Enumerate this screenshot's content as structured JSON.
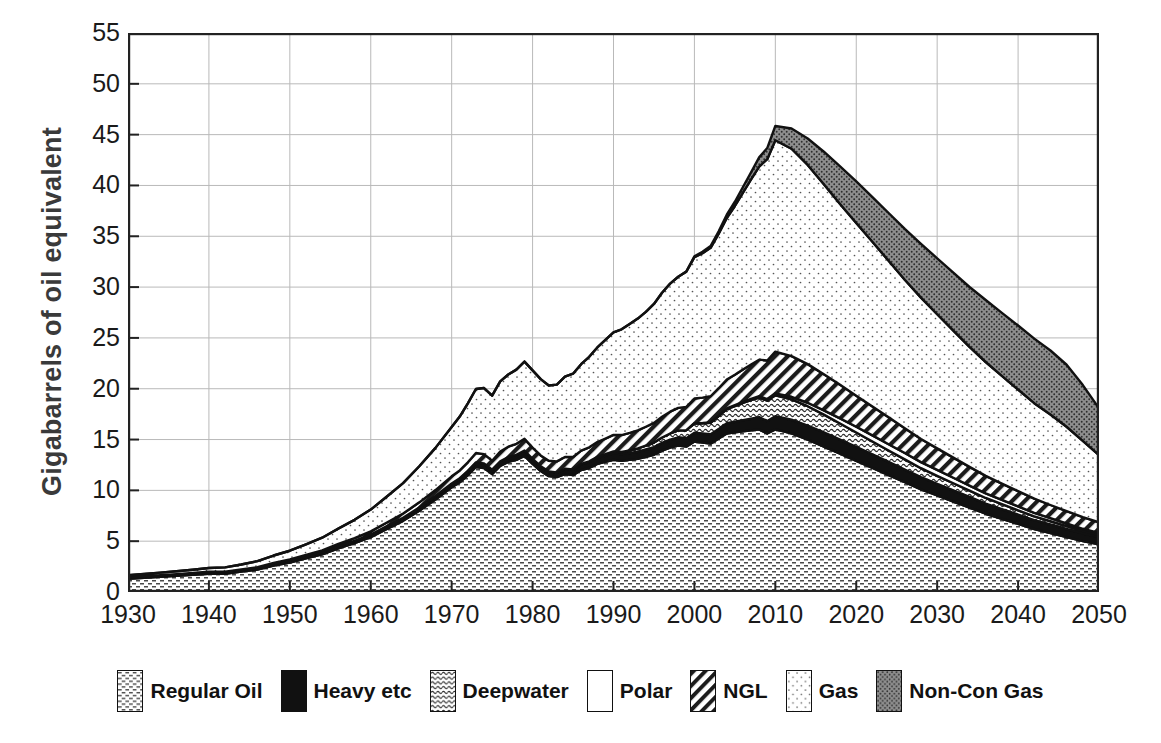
{
  "chart_data": {
    "type": "area",
    "title": "",
    "subtitle": "",
    "xlabel": "",
    "ylabel": "Gigabarrels of oil equivalent",
    "credit": "Credit: the Association for the Study of Peak Oil",
    "xlim": [
      1930,
      2050
    ],
    "ylim": [
      0,
      55
    ],
    "xticks": [
      1930,
      1940,
      1950,
      1960,
      1970,
      1980,
      1990,
      2000,
      2010,
      2020,
      2030,
      2040,
      2050
    ],
    "yticks": [
      0,
      5,
      10,
      15,
      20,
      25,
      30,
      35,
      40,
      45,
      50,
      55
    ],
    "grid": true,
    "legend_position": "bottom",
    "stacked": true,
    "x": [
      1930,
      1932,
      1934,
      1936,
      1938,
      1940,
      1942,
      1944,
      1946,
      1948,
      1950,
      1952,
      1954,
      1956,
      1958,
      1960,
      1962,
      1964,
      1966,
      1968,
      1970,
      1971,
      1972,
      1973,
      1974,
      1975,
      1976,
      1977,
      1978,
      1979,
      1980,
      1981,
      1982,
      1983,
      1984,
      1985,
      1986,
      1987,
      1988,
      1989,
      1990,
      1991,
      1992,
      1993,
      1994,
      1995,
      1996,
      1997,
      1998,
      1999,
      2000,
      2001,
      2002,
      2003,
      2004,
      2005,
      2006,
      2007,
      2008,
      2009,
      2010,
      2012,
      2014,
      2016,
      2018,
      2020,
      2022,
      2024,
      2026,
      2028,
      2030,
      2032,
      2034,
      2036,
      2038,
      2040,
      2042,
      2044,
      2046,
      2048,
      2050
    ],
    "series": [
      {
        "name": "Regular Oil",
        "pattern": "stipple-dash",
        "values": [
          1.3,
          1.4,
          1.5,
          1.6,
          1.7,
          1.8,
          1.8,
          2.0,
          2.2,
          2.6,
          2.9,
          3.3,
          3.7,
          4.3,
          4.8,
          5.4,
          6.2,
          7.0,
          8.0,
          9.1,
          10.3,
          10.8,
          11.5,
          12.3,
          12.2,
          11.6,
          12.4,
          12.8,
          13.0,
          13.4,
          12.6,
          11.9,
          11.4,
          11.3,
          11.6,
          11.5,
          12.0,
          12.2,
          12.6,
          12.8,
          13.0,
          12.9,
          13.0,
          13.1,
          13.3,
          13.5,
          13.9,
          14.2,
          14.4,
          14.3,
          14.8,
          14.7,
          14.6,
          15.1,
          15.6,
          15.7,
          15.8,
          15.9,
          16.0,
          15.6,
          16.0,
          15.6,
          15.0,
          14.3,
          13.6,
          12.9,
          12.2,
          11.5,
          10.8,
          10.1,
          9.5,
          8.9,
          8.3,
          7.7,
          7.2,
          6.7,
          6.2,
          5.8,
          5.4,
          5.0,
          4.7
        ]
      },
      {
        "name": "Heavy etc",
        "pattern": "solid-black",
        "values": [
          0.1,
          0.1,
          0.1,
          0.1,
          0.1,
          0.12,
          0.12,
          0.12,
          0.14,
          0.15,
          0.16,
          0.18,
          0.2,
          0.22,
          0.24,
          0.26,
          0.28,
          0.3,
          0.32,
          0.35,
          0.38,
          0.4,
          0.42,
          0.45,
          0.45,
          0.44,
          0.46,
          0.48,
          0.5,
          0.52,
          0.5,
          0.48,
          0.47,
          0.47,
          0.5,
          0.52,
          0.55,
          0.58,
          0.6,
          0.62,
          0.65,
          0.66,
          0.68,
          0.7,
          0.72,
          0.75,
          0.78,
          0.8,
          0.82,
          0.84,
          0.88,
          0.9,
          0.92,
          0.95,
          1.0,
          1.05,
          1.1,
          1.15,
          1.2,
          1.22,
          1.3,
          1.35,
          1.38,
          1.4,
          1.4,
          1.38,
          1.35,
          1.3,
          1.25,
          1.2,
          1.15,
          1.1,
          1.05,
          1.0,
          0.96,
          0.92,
          0.88,
          0.84,
          0.8,
          0.76,
          0.72
        ]
      },
      {
        "name": "Deepwater",
        "pattern": "wave-texture",
        "values": [
          0,
          0,
          0,
          0,
          0,
          0,
          0,
          0,
          0,
          0,
          0,
          0,
          0,
          0,
          0,
          0,
          0,
          0,
          0,
          0,
          0,
          0,
          0,
          0,
          0,
          0,
          0,
          0,
          0,
          0,
          0,
          0,
          0,
          0,
          0.02,
          0.04,
          0.06,
          0.08,
          0.1,
          0.14,
          0.18,
          0.22,
          0.26,
          0.32,
          0.38,
          0.45,
          0.52,
          0.6,
          0.68,
          0.78,
          0.9,
          1.0,
          1.12,
          1.25,
          1.4,
          1.55,
          1.7,
          1.82,
          1.92,
          2.0,
          2.05,
          2.0,
          1.9,
          1.75,
          1.58,
          1.42,
          1.26,
          1.12,
          1.0,
          0.88,
          0.78,
          0.7,
          0.62,
          0.55,
          0.48,
          0.42,
          0.36,
          0.32,
          0.28,
          0.24,
          0.2
        ]
      },
      {
        "name": "Polar",
        "pattern": "white",
        "values": [
          0,
          0,
          0,
          0,
          0,
          0,
          0,
          0,
          0,
          0,
          0,
          0,
          0,
          0,
          0,
          0,
          0,
          0,
          0,
          0,
          0,
          0,
          0,
          0,
          0,
          0,
          0,
          0,
          0,
          0,
          0,
          0,
          0,
          0,
          0,
          0,
          0,
          0,
          0,
          0,
          0,
          0,
          0,
          0,
          0,
          0,
          0,
          0,
          0,
          0,
          0.02,
          0.03,
          0.04,
          0.05,
          0.06,
          0.08,
          0.1,
          0.12,
          0.14,
          0.16,
          0.2,
          0.26,
          0.34,
          0.42,
          0.5,
          0.56,
          0.6,
          0.62,
          0.62,
          0.6,
          0.58,
          0.54,
          0.5,
          0.46,
          0.42,
          0.38,
          0.34,
          0.3,
          0.26,
          0.22,
          0.18
        ]
      },
      {
        "name": "NGL",
        "pattern": "diagonal-hatch",
        "values": [
          0.05,
          0.05,
          0.06,
          0.06,
          0.07,
          0.08,
          0.08,
          0.09,
          0.1,
          0.12,
          0.14,
          0.16,
          0.19,
          0.22,
          0.26,
          0.3,
          0.36,
          0.42,
          0.5,
          0.58,
          0.7,
          0.76,
          0.84,
          0.92,
          0.92,
          0.88,
          0.96,
          1.02,
          1.08,
          1.15,
          1.1,
          1.06,
          1.05,
          1.08,
          1.16,
          1.22,
          1.3,
          1.38,
          1.46,
          1.54,
          1.62,
          1.66,
          1.72,
          1.78,
          1.86,
          1.94,
          2.04,
          2.14,
          2.22,
          2.3,
          2.44,
          2.5,
          2.58,
          2.7,
          2.84,
          3.0,
          3.2,
          3.4,
          3.6,
          3.8,
          4.1,
          4.0,
          3.8,
          3.55,
          3.3,
          3.05,
          2.85,
          2.65,
          2.45,
          2.28,
          2.12,
          1.98,
          1.84,
          1.72,
          1.6,
          1.5,
          1.4,
          1.3,
          1.22,
          1.14,
          1.06
        ]
      },
      {
        "name": "Gas",
        "pattern": "light-stipple",
        "values": [
          0.2,
          0.22,
          0.25,
          0.28,
          0.32,
          0.36,
          0.42,
          0.5,
          0.6,
          0.72,
          0.86,
          1.05,
          1.25,
          1.5,
          1.8,
          2.15,
          2.55,
          3.0,
          3.55,
          4.15,
          4.85,
          5.3,
          5.8,
          6.3,
          6.5,
          6.4,
          6.9,
          7.1,
          7.3,
          7.6,
          7.6,
          7.5,
          7.4,
          7.55,
          7.9,
          8.2,
          8.5,
          8.9,
          9.3,
          9.7,
          10.1,
          10.4,
          10.7,
          11.0,
          11.3,
          11.7,
          12.2,
          12.6,
          12.9,
          13.3,
          13.9,
          14.2,
          14.6,
          15.2,
          15.9,
          16.6,
          17.4,
          18.2,
          19.0,
          19.8,
          20.8,
          20.4,
          19.6,
          18.7,
          17.8,
          17.0,
          16.2,
          15.4,
          14.6,
          13.9,
          13.2,
          12.5,
          11.8,
          11.2,
          10.6,
          10.0,
          9.4,
          8.9,
          8.3,
          7.5,
          6.6
        ]
      },
      {
        "name": "Non-Con Gas",
        "pattern": "dark-stipple",
        "values": [
          0,
          0,
          0,
          0,
          0,
          0,
          0,
          0,
          0,
          0,
          0,
          0,
          0,
          0,
          0,
          0,
          0,
          0,
          0,
          0,
          0,
          0,
          0,
          0,
          0,
          0,
          0,
          0,
          0,
          0,
          0,
          0,
          0,
          0,
          0,
          0,
          0,
          0,
          0,
          0,
          0,
          0,
          0,
          0,
          0,
          0,
          0,
          0,
          0,
          0,
          0.1,
          0.14,
          0.18,
          0.24,
          0.32,
          0.42,
          0.55,
          0.7,
          0.9,
          1.1,
          1.4,
          2.0,
          2.6,
          3.2,
          3.7,
          4.1,
          4.4,
          4.7,
          5.0,
          5.3,
          5.5,
          5.7,
          5.9,
          6.1,
          6.2,
          6.3,
          6.35,
          6.3,
          6.1,
          5.5,
          4.6
        ]
      }
    ]
  },
  "legend": {
    "items": [
      {
        "label": "Regular Oil",
        "pattern": "stipple-dash"
      },
      {
        "label": "Heavy etc",
        "pattern": "solid-black"
      },
      {
        "label": "Deepwater",
        "pattern": "wave-texture"
      },
      {
        "label": "Polar",
        "pattern": "white"
      },
      {
        "label": "NGL",
        "pattern": "diagonal-hatch"
      },
      {
        "label": "Gas",
        "pattern": "light-stipple"
      },
      {
        "label": "Non-Con Gas",
        "pattern": "dark-stipple"
      }
    ]
  }
}
